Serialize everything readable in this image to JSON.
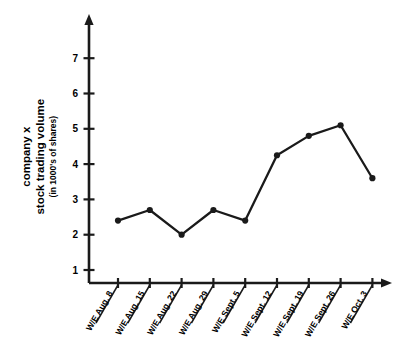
{
  "chart_data": {
    "type": "line",
    "title": "",
    "subtitle": "",
    "xlabel": "",
    "ylabel": "company x stock trading volume (in 1000's of shares)",
    "ylabel_lines": [
      "company x",
      "stock trading volume",
      "(in 1000's of shares)"
    ],
    "categories": [
      "W/E Aug. 8",
      "W/E Aug. 15",
      "W/E Aug. 22",
      "W/E Aug. 29",
      "W/E Sept. 5",
      "W/E Sept. 12",
      "W/E Sept. 19",
      "W/E Sept. 26",
      "W/E Oct. 3"
    ],
    "values": [
      2.4,
      2.7,
      2.0,
      2.7,
      2.4,
      4.25,
      4.8,
      5.1,
      3.6
    ],
    "yticks": [
      1,
      2,
      3,
      4,
      5,
      6,
      7
    ],
    "ytick_labels": [
      "1",
      "2",
      "3",
      "4",
      "5",
      "6",
      "7"
    ],
    "ylim": [
      0.62,
      7.6
    ],
    "grid": false,
    "legend": null,
    "series_color": "#1a1a1a",
    "axis_color": "#1a1a1a",
    "marker": "circle",
    "axis_arrows": true
  }
}
